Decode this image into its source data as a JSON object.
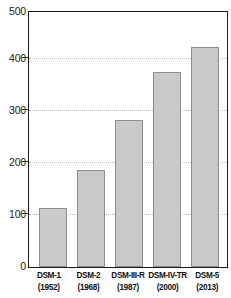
{
  "chart_data": {
    "type": "bar",
    "title": "",
    "xlabel": "",
    "ylabel": "",
    "ylim": [
      0,
      500
    ],
    "yticks": [
      0,
      100,
      200,
      300,
      400,
      500
    ],
    "grid": true,
    "legend": "none",
    "categories": [
      "DSM-1",
      "DSM-2",
      "DSM-III-R",
      "DSM-IV-TR",
      "DSM-5"
    ],
    "category_years": [
      "(1952)",
      "(1968)",
      "(1987)",
      "(2000)",
      "(2013)"
    ],
    "values": [
      115,
      190,
      288,
      383,
      432
    ],
    "bar_color": "#c9c9c9",
    "bar_border_color": "#8d8d8d",
    "frame_color": "#1a1a1a",
    "gridline_color": "#b9b9b9"
  }
}
